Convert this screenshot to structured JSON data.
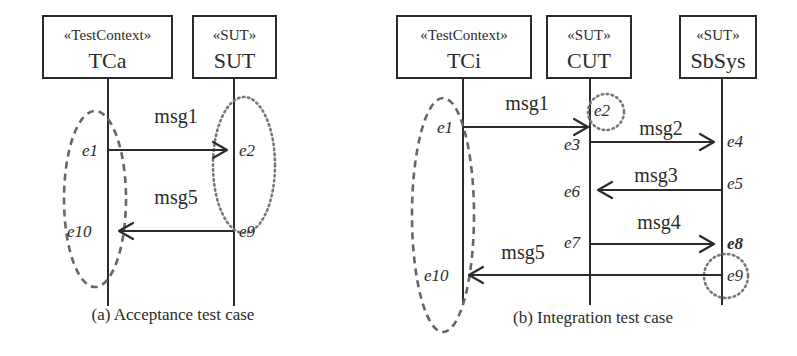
{
  "panels": {
    "a": {
      "caption": "(a) Acceptance test case",
      "lifelines": [
        {
          "stereotype": "«TestContext»",
          "name": "TCa"
        },
        {
          "stereotype": "«SUT»",
          "name": "SUT"
        }
      ],
      "messages": [
        {
          "label": "msg1",
          "from": "TCa",
          "to": "SUT",
          "send_event": "e1",
          "receive_event": "e2"
        },
        {
          "label": "msg5",
          "from": "SUT",
          "to": "TCa",
          "send_event": "e9",
          "receive_event": "e10"
        }
      ],
      "events": {
        "e1": "e1",
        "e2": "e2",
        "e9": "e9",
        "e10": "e10"
      },
      "groupings": [
        {
          "style": "dashed",
          "on": "TCa",
          "events": [
            "e1",
            "e10"
          ]
        },
        {
          "style": "dotted",
          "on": "SUT",
          "events": [
            "e2",
            "e9"
          ]
        }
      ]
    },
    "b": {
      "caption": "(b) Integration test case",
      "lifelines": [
        {
          "stereotype": "«TestContext»",
          "name": "TCi"
        },
        {
          "stereotype": "«SUT»",
          "name": "CUT"
        },
        {
          "stereotype": "«SUT»",
          "name": "SbSys"
        }
      ],
      "messages": [
        {
          "label": "msg1",
          "from": "TCi",
          "to": "CUT",
          "send_event": "e1",
          "receive_event": "e2"
        },
        {
          "label": "msg2",
          "from": "CUT",
          "to": "SbSys",
          "send_event": "e3",
          "receive_event": "e4"
        },
        {
          "label": "msg3",
          "from": "SbSys",
          "to": "CUT",
          "send_event": "e5",
          "receive_event": "e6"
        },
        {
          "label": "msg4",
          "from": "CUT",
          "to": "SbSys",
          "send_event": "e7",
          "receive_event": "e8"
        },
        {
          "label": "msg5",
          "from": "SbSys",
          "to": "TCi",
          "send_event": "e9",
          "receive_event": "e10"
        }
      ],
      "events": {
        "e1": "e1",
        "e2": "e2",
        "e3": "e3",
        "e4": "e4",
        "e5": "e5",
        "e6": "e6",
        "e7": "e7",
        "e8": "e8",
        "e9": "e9",
        "e10": "e10"
      },
      "groupings": [
        {
          "style": "dashed",
          "on": "TCi",
          "events": [
            "e1",
            "e10"
          ]
        },
        {
          "style": "dotted",
          "on": "CUT",
          "events": [
            "e2"
          ]
        },
        {
          "style": "dotted",
          "on": "SbSys",
          "events": [
            "e9"
          ]
        }
      ]
    }
  },
  "colors": {
    "line": "#2b2b2b",
    "dashed_group": "#666666",
    "dotted_group": "#777777",
    "background": "#ffffff"
  }
}
